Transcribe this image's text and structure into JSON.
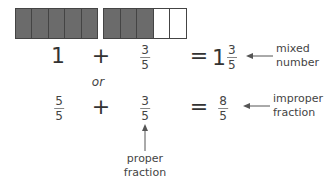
{
  "bars": [
    {
      "name": "whole-bar",
      "cells": [
        "filled",
        "filled",
        "filled",
        "filled",
        "filled"
      ]
    },
    {
      "name": "fraction-bar",
      "cells": [
        "filled",
        "filled",
        "filled",
        "empty",
        "empty"
      ]
    }
  ],
  "row1": {
    "whole": "1",
    "plus": "+",
    "fraction": {
      "num": "3",
      "den": "5"
    },
    "equals": "=",
    "mixed": {
      "whole": "1",
      "num": "3",
      "den": "5"
    },
    "label_line1": "mixed",
    "label_line2": "number"
  },
  "or_text": "or",
  "row2": {
    "fraction_a": {
      "num": "5",
      "den": "5"
    },
    "plus": "+",
    "fraction_b": {
      "num": "3",
      "den": "5"
    },
    "equals": "=",
    "result": {
      "num": "8",
      "den": "5"
    },
    "label_line1": "improper",
    "label_line2": "fraction"
  },
  "proper_label": {
    "line1": "proper",
    "line2": "fraction"
  },
  "colors": {
    "filled": "#6b6b6b",
    "text": "#333333",
    "arrow": "#555555"
  }
}
